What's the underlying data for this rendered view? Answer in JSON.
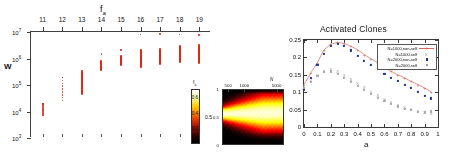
{
  "figure": {
    "panels": [
      "scatter-fa-W",
      "inset-heatmap",
      "activated-clones"
    ]
  },
  "left": {
    "title": "f",
    "title_sub": "a",
    "ylabel": "W",
    "x_ticks": [
      "11",
      "12",
      "13",
      "14",
      "15",
      "16",
      "17",
      "18",
      "19"
    ],
    "y_ticks": [
      "10",
      "10",
      "10",
      "10",
      "10"
    ],
    "y_exponents": [
      "7",
      "6",
      "5",
      "4",
      "3"
    ],
    "marker_color": "#d92b16"
  },
  "inset": {
    "colorbar_ticks": [
      "0.2",
      "0.4",
      "0.6"
    ],
    "fa_label": "f",
    "fa_sub": "a",
    "mid_label": "0.5",
    "heat_x_ticks": [
      "500",
      "1000",
      "5000"
    ],
    "heat_y_ticks": [
      "1",
      "0.5",
      "0"
    ],
    "heat_x_label": "N"
  },
  "right": {
    "title": "Activated Clones",
    "xlabel": "a",
    "y_ticks": [
      "0.25",
      "0.2",
      "0.15",
      "0.1",
      "0.05",
      "0"
    ],
    "x_ticks": [
      "0",
      "0.1",
      "0.2",
      "0.3",
      "0.4",
      "0.5",
      "0.6",
      "0.7",
      "0.8",
      "0.9",
      "1"
    ],
    "legend": [
      {
        "label": "N=1000,non-self",
        "symbol": "line-plus",
        "color": "#cf6a5a"
      },
      {
        "label": "N=1000,self",
        "symbol": "x",
        "color": "#999999"
      },
      {
        "label": "N=2000,non-self",
        "symbol": "square",
        "color": "#1d2f8f"
      },
      {
        "label": "N=2000,self",
        "symbol": "open-square",
        "color": "#9a9a9a"
      }
    ]
  },
  "chart_data": [
    {
      "type": "scatter",
      "title": "f_a",
      "xlabel": "f_a",
      "ylabel": "W",
      "xlim": [
        10.4,
        19.6
      ],
      "ylim": [
        1000,
        10000000
      ],
      "yscale": "log",
      "x": [
        11,
        12,
        13,
        14,
        15,
        16,
        17,
        18,
        19
      ],
      "series": [
        {
          "name": "W range per f_a",
          "low": [
            7000,
            26000,
            42000,
            330000,
            520000,
            420000,
            560000,
            700000,
            600000
          ],
          "high": [
            19000,
            190000,
            330000,
            900000,
            1300000,
            2200000,
            2600000,
            3100000,
            3400000
          ],
          "outliers": [
            [
              11,
              19000
            ],
            [
              12,
              190000
            ],
            [
              13,
              330000
            ],
            [
              14,
              1500000
            ],
            [
              15,
              2100000
            ],
            [
              16,
              8000000
            ],
            [
              17,
              8200000
            ],
            [
              18,
              8000000
            ],
            [
              19,
              7800000
            ]
          ]
        }
      ]
    },
    {
      "type": "heatmap",
      "xlabel": "N",
      "x_ticks": [
        500,
        1000,
        5000
      ],
      "y_ticks": [
        0,
        0.5,
        1
      ],
      "colorbar_ticks": [
        0.2,
        0.4,
        0.6
      ],
      "colormap": "hot",
      "zlim": [
        0.0,
        0.7
      ]
    },
    {
      "type": "scatter",
      "title": "Activated Clones",
      "xlabel": "a",
      "ylabel": "",
      "xlim": [
        0,
        1
      ],
      "ylim": [
        0,
        0.25
      ],
      "x": [
        0,
        0.05,
        0.1,
        0.15,
        0.2,
        0.25,
        0.3,
        0.35,
        0.4,
        0.45,
        0.5,
        0.55,
        0.6,
        0.65,
        0.7,
        0.75,
        0.8,
        0.85,
        0.9,
        0.95
      ],
      "series": [
        {
          "name": "N=1000,non-self",
          "values": [
            0.122,
            0.155,
            0.185,
            0.222,
            0.238,
            0.243,
            0.24,
            0.232,
            0.222,
            0.208,
            0.196,
            0.185,
            0.172,
            0.16,
            0.15,
            0.141,
            0.131,
            0.122,
            0.112,
            0.101
          ]
        },
        {
          "name": "N=1000,self",
          "values": [
            0.118,
            0.136,
            0.15,
            0.162,
            0.166,
            0.16,
            0.15,
            0.138,
            0.126,
            0.114,
            0.102,
            0.091,
            0.081,
            0.072,
            0.064,
            0.057,
            0.051,
            0.046,
            0.043,
            0.041
          ]
        },
        {
          "name": "N=2000,non-self",
          "values": [
            0.108,
            0.142,
            0.178,
            0.21,
            0.232,
            0.238,
            0.232,
            0.22,
            0.205,
            0.19,
            0.178,
            0.166,
            0.152,
            0.14,
            0.132,
            0.122,
            0.112,
            0.1,
            0.09,
            0.082
          ]
        },
        {
          "name": "N=2000,self",
          "values": [
            0.112,
            0.13,
            0.146,
            0.158,
            0.16,
            0.152,
            0.142,
            0.13,
            0.118,
            0.106,
            0.094,
            0.084,
            0.074,
            0.066,
            0.059,
            0.053,
            0.048,
            0.044,
            0.042,
            0.045
          ]
        }
      ]
    }
  ]
}
